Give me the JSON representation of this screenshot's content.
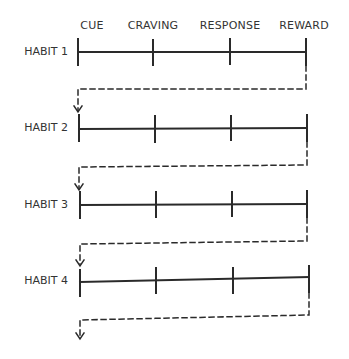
{
  "diagram": {
    "stages": [
      "CUE",
      "CRAVING",
      "RESPONSE",
      "REWARD"
    ],
    "habits": [
      {
        "label": "HABIT 1",
        "y": 52
      },
      {
        "label": "HABIT 2",
        "y": 128
      },
      {
        "label": "HABIT 3",
        "y": 205
      },
      {
        "label": "HABIT 4",
        "y": 281
      }
    ],
    "line_color": "#2a2a2a",
    "background": "#ffffff"
  }
}
